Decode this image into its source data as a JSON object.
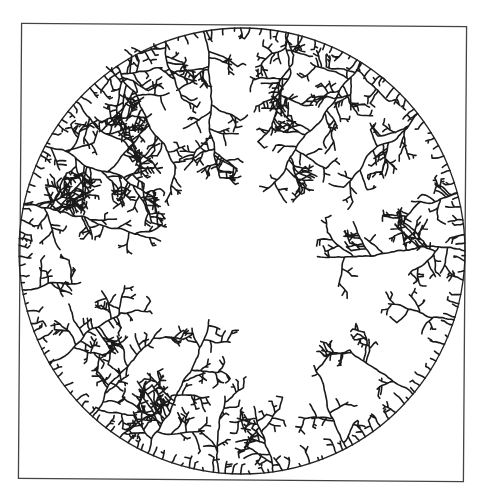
{
  "figure": {
    "frame": {
      "x1": 20,
      "y1": 25,
      "x2": 465,
      "y2": 480,
      "color": "#444444"
    },
    "circle": {
      "cx": 242,
      "cy": 251,
      "r": 223,
      "color": "#222222"
    },
    "ink_color": "#1a1a1a",
    "background": "#ffffff",
    "major_branches": [
      {
        "angle_deg": -100,
        "length": 150
      },
      {
        "angle_deg": -78,
        "length": 110
      },
      {
        "angle_deg": -58,
        "length": 165
      },
      {
        "angle_deg": -38,
        "length": 110
      },
      {
        "angle_deg": -15,
        "length": 50
      },
      {
        "angle_deg": 0,
        "length": 150
      },
      {
        "angle_deg": 18,
        "length": 70
      },
      {
        "angle_deg": 40,
        "length": 80
      },
      {
        "angle_deg": 62,
        "length": 90
      },
      {
        "angle_deg": 82,
        "length": 70
      },
      {
        "angle_deg": 96,
        "length": 80
      },
      {
        "angle_deg": 115,
        "length": 150
      },
      {
        "angle_deg": 132,
        "length": 115
      },
      {
        "angle_deg": 150,
        "length": 90
      },
      {
        "angle_deg": 170,
        "length": 60
      },
      {
        "angle_deg": 192,
        "length": 145
      },
      {
        "angle_deg": 208,
        "length": 130
      },
      {
        "angle_deg": 222,
        "length": 115
      },
      {
        "angle_deg": 236,
        "length": 120
      },
      {
        "angle_deg": 250,
        "length": 60
      }
    ],
    "rim_density": 150,
    "seed": 7
  }
}
